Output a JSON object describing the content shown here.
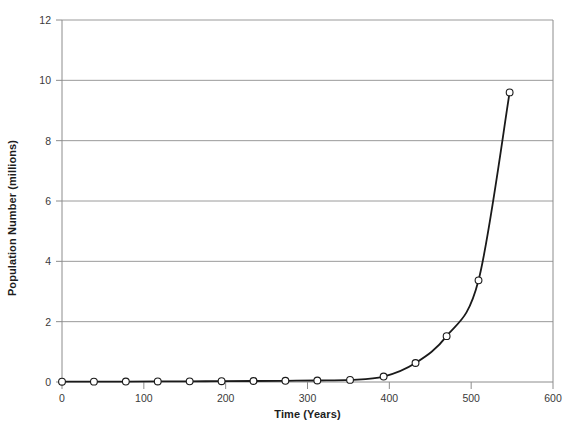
{
  "chart_data": {
    "type": "line",
    "title": "",
    "xlabel": "Time (Years)",
    "ylabel": "Population Number (millions)",
    "xlim": [
      0,
      600
    ],
    "ylim": [
      0,
      12
    ],
    "xticks": [
      0,
      100,
      200,
      300,
      400,
      500,
      600
    ],
    "yticks": [
      0,
      2,
      4,
      6,
      8,
      10,
      12
    ],
    "xtick_labels": [
      "0",
      "100",
      "200",
      "300",
      "400",
      "500",
      "600"
    ],
    "ytick_labels": [
      "0",
      "2",
      "4",
      "6",
      "8",
      "10",
      "12"
    ],
    "grid": "horizontal",
    "legend": "none",
    "marker": "open-circle",
    "line_color": "#1a1a1a",
    "marker_fill": "#ffffff",
    "marker_edge": "#1a1a1a",
    "grid_color": "#9a9a9a",
    "axis_color": "#8c8c8c",
    "series": [
      {
        "name": "Population",
        "x": [
          0,
          39,
          78,
          117,
          156,
          195,
          234,
          273,
          312,
          352,
          393,
          432,
          470,
          509,
          547
        ],
        "values": [
          0.01,
          0.012,
          0.015,
          0.018,
          0.022,
          0.027,
          0.033,
          0.04,
          0.05,
          0.07,
          0.18,
          0.63,
          1.52,
          3.37,
          9.6
        ]
      }
    ]
  },
  "axes": {
    "x_title": "Time (Years)",
    "y_title": "Population Number (millions)"
  }
}
